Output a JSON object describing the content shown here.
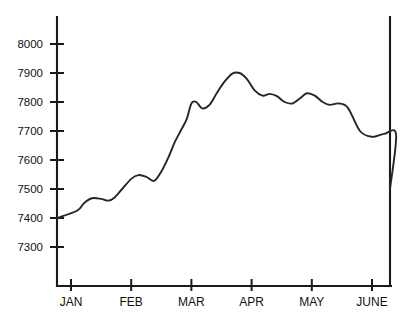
{
  "chart_data": {
    "type": "line",
    "title": "",
    "subtitle": "",
    "xlabel": "",
    "ylabel": "",
    "grid": false,
    "legend": null,
    "legend_position": "none",
    "ylim": [
      7250,
      8050
    ],
    "yticks": [
      7300,
      7400,
      7500,
      7600,
      7700,
      7800,
      7900,
      8000
    ],
    "ytick_labels": [
      "7300",
      "7400",
      "7500",
      "7600",
      "7700",
      "7800",
      "7900",
      "8000"
    ],
    "xticks": [
      "JAN",
      "FEB",
      "MAR",
      "APR",
      "MAY",
      "JUNE"
    ],
    "xtick_labels": [
      "JAN",
      "FEB",
      "MAR",
      "APR",
      "MAY",
      "JUNE"
    ],
    "xlim": [
      "JAN",
      "JUNE"
    ],
    "series": [
      {
        "name": "index",
        "color": "#262626",
        "x": [
          0.0,
          0.1,
          0.22,
          0.35,
          0.5,
          0.62,
          0.72,
          0.85,
          1.0,
          1.12,
          1.25,
          1.38,
          1.5,
          1.62,
          1.72,
          1.82,
          1.92,
          2.0,
          2.08,
          2.18,
          2.3,
          2.42,
          2.55,
          2.68,
          2.8,
          2.92,
          3.05,
          3.18,
          3.3,
          3.42,
          3.55,
          3.68,
          3.8,
          3.92,
          4.05,
          4.18,
          4.3,
          4.45,
          4.6,
          4.8,
          5.0,
          5.2,
          5.4,
          5.6
        ],
        "values": [
          7400,
          7425,
          7452,
          7468,
          7466,
          7460,
          7470,
          7500,
          7535,
          7548,
          7542,
          7528,
          7560,
          7610,
          7660,
          7700,
          7740,
          7795,
          7800,
          7778,
          7790,
          7830,
          7870,
          7898,
          7900,
          7880,
          7840,
          7822,
          7828,
          7820,
          7800,
          7795,
          7812,
          7830,
          7822,
          7800,
          7790,
          7795,
          7780,
          7700,
          7680,
          7690,
          7688,
          7640
        ]
      }
    ],
    "curve_annotations": {
      "start_value": 7400,
      "peak_value": 7900,
      "end_value": 7500,
      "trend": "rise to peak near MAR then decline to JUNE"
    }
  },
  "axes": {
    "y_axis_name": "y-axis",
    "x_axis_name": "x-axis",
    "right_border_name": "right-border"
  }
}
